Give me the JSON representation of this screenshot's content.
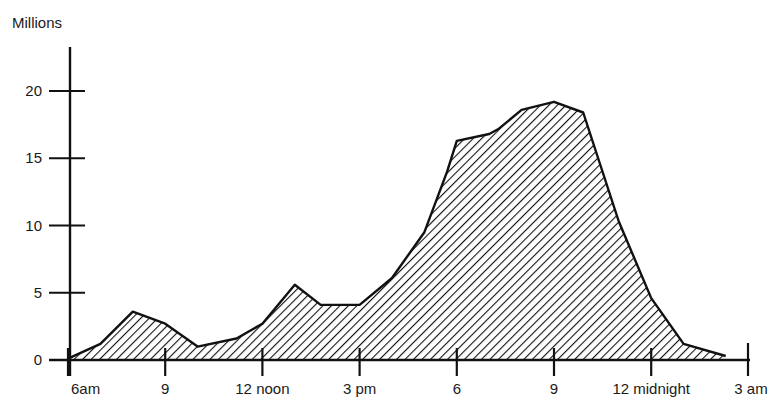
{
  "chart_data": {
    "type": "area",
    "title": "",
    "ylabel": "Millions",
    "xlabel": "",
    "ylim": [
      0,
      20
    ],
    "y_ticks": [
      0,
      5,
      10,
      15,
      20
    ],
    "y_tick_labels": [
      "0",
      "5",
      "10",
      "15",
      "20"
    ],
    "x_range_hours": [
      6,
      27
    ],
    "x_ticks": [
      6,
      9,
      12,
      15,
      18,
      21,
      24,
      27
    ],
    "x_tick_labels": [
      "6am",
      "9",
      "12 noon",
      "3 pm",
      "6",
      "9",
      "12 midnight",
      "3 am"
    ],
    "grid": false,
    "legend": "none",
    "fill_style": "diagonal-hatch",
    "series": [
      {
        "name": "Viewers",
        "x_hours": [
          6,
          7,
          8,
          9,
          10,
          11.2,
          12,
          13,
          13.8,
          15,
          16,
          17,
          17.7,
          18,
          19,
          19.3,
          20,
          21,
          21.9,
          23,
          24,
          25,
          26.3
        ],
        "values": [
          0.1,
          1.2,
          3.6,
          2.7,
          1.0,
          1.6,
          2.7,
          5.6,
          4.1,
          4.1,
          6.1,
          9.5,
          14.0,
          16.3,
          16.8,
          17.2,
          18.6,
          19.2,
          18.4,
          10.3,
          4.6,
          1.2,
          0.3
        ]
      }
    ]
  }
}
